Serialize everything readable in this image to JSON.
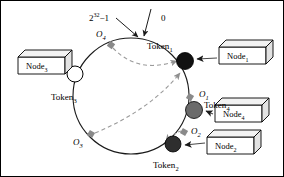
{
  "figure": {
    "kind": "chord-dht-ring-diagram",
    "background": "#ffffff",
    "border_color": "#000000"
  },
  "ring": {
    "cx": 130,
    "cy": 95,
    "r": 58,
    "stroke": "#1a1a1a"
  },
  "annotations": {
    "max_key": {
      "base": "2",
      "exponent": "32",
      "suffix": "−1",
      "text": "2³²−1",
      "x": 88,
      "y": 11
    },
    "zero": {
      "text": "0",
      "x": 160,
      "y": 13
    }
  },
  "ring_markers": [
    {
      "name": "O1",
      "label": "O",
      "sub": "1",
      "color": "#8a8a8a",
      "x": 189,
      "y": 96,
      "label_x": 198,
      "label_y": 89
    },
    {
      "name": "O2",
      "label": "O",
      "sub": "2",
      "color": "#8a8a8a",
      "x": 183,
      "y": 131,
      "label_x": 190,
      "label_y": 126
    },
    {
      "name": "O3",
      "label": "O",
      "sub": "3",
      "color": "#8a8a8a",
      "x": 90,
      "y": 133,
      "label_x": 72,
      "label_y": 137
    },
    {
      "name": "O4",
      "label": "O",
      "sub": "4",
      "color": "#8a8a8a",
      "x": 110,
      "y": 44,
      "label_x": 95,
      "label_y": 29
    }
  ],
  "tokens": [
    {
      "name": "Token1",
      "label": "Token",
      "sub": "1",
      "fill": "#111111",
      "stroke": "#000000",
      "x": 184,
      "y": 60,
      "r": 8.5,
      "label_x": 146,
      "label_y": 41
    },
    {
      "name": "Token2",
      "label": "Token",
      "sub": "2",
      "fill": "#2e2e2e",
      "stroke": "#000000",
      "x": 172,
      "y": 143,
      "r": 8.0,
      "label_x": 152,
      "label_y": 160
    },
    {
      "name": "Token3",
      "label": "Token",
      "sub": "3",
      "fill": "#ffffff",
      "stroke": "#000000",
      "x": 74,
      "y": 73,
      "r": 8.0,
      "label_x": 50,
      "label_y": 92
    },
    {
      "name": "Token4",
      "label": "Token",
      "sub": "4",
      "fill": "#6b6b6b",
      "stroke": "#000000",
      "x": 193,
      "y": 109,
      "r": 8.5,
      "label_x": 203,
      "label_y": 100
    }
  ],
  "nodes": [
    {
      "name": "Node1",
      "label": "Node",
      "sub": "1",
      "x": 218,
      "y": 46,
      "w": 48,
      "h": 17,
      "d": 7,
      "target": "Token1"
    },
    {
      "name": "Node2",
      "label": "Node",
      "sub": "2",
      "x": 206,
      "y": 136,
      "w": 48,
      "h": 17,
      "d": 7,
      "target": "Token2"
    },
    {
      "name": "Node3",
      "label": "Node",
      "sub": "3",
      "x": 17,
      "y": 56,
      "w": 48,
      "h": 17,
      "d": 7,
      "target": "Token3"
    },
    {
      "name": "Node4",
      "label": "Node",
      "sub": "4",
      "x": 214,
      "y": 104,
      "w": 48,
      "h": 17,
      "d": 7,
      "target": "Token4"
    }
  ],
  "dashed_routes": [
    {
      "name": "route-o4-to-token1",
      "from": "O4",
      "to": "Token1",
      "color": "#9a9a9a"
    },
    {
      "name": "route-o3-to-token1",
      "from": "O3",
      "to": "Token1",
      "color": "#9a9a9a"
    },
    {
      "name": "route-o2-to-token2",
      "from": "O2",
      "to": "Token2",
      "color": "#9a9a9a"
    },
    {
      "name": "route-o1-to-token4",
      "from": "O1",
      "to": "Token4",
      "color": "#9a9a9a"
    }
  ]
}
